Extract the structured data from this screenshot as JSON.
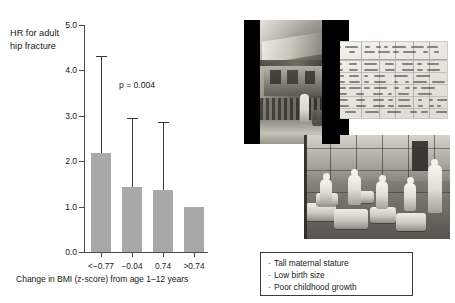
{
  "chart_data": {
    "type": "bar",
    "title": "",
    "xlabel": "Change in BMI (z-score) from age 1–12 years",
    "ylabel": "HR for adult hip fracture",
    "categories": [
      "<−0.77",
      "−0.04",
      "0.74",
      ">0.74"
    ],
    "values": [
      2.19,
      1.44,
      1.37,
      1.0
    ],
    "error_upper": [
      4.32,
      2.95,
      2.86,
      null
    ],
    "ytick_labels": [
      "0.0",
      "1.0",
      "2.0",
      "3.0",
      "4.0",
      "5.0"
    ],
    "ytick_values": [
      0.0,
      1.0,
      2.0,
      3.0,
      4.0,
      5.0
    ],
    "ylim": [
      0.0,
      5.0
    ],
    "grid": false,
    "legend": "none",
    "annotation": "p = 0.004",
    "bar_color": "#a9a9a9",
    "axis_color": "#4a4a4a",
    "error_color": "#3a3a3a"
  },
  "chart": {
    "ylabel_line1": "HR for adult",
    "ylabel_line2": "hip fracture"
  },
  "collage": {
    "photo1_name": "historic-house-street-photograph",
    "photo2_name": "handwritten-birth-register-document",
    "photo3_name": "historic-hospital-nursery-photograph"
  },
  "bullets": {
    "items": [
      {
        "marker": "·",
        "text": "Tall maternal stature"
      },
      {
        "marker": "·",
        "text": "Low birth size"
      },
      {
        "marker": "·",
        "text": "Poor childhood growth"
      }
    ]
  }
}
